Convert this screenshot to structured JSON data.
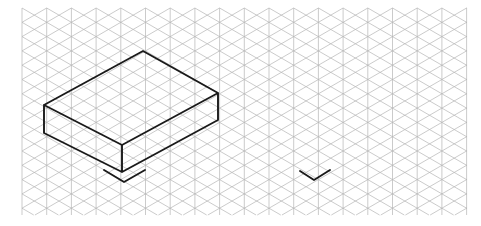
{
  "canvas": {
    "width": 481,
    "height": 226,
    "background_color": "#ffffff",
    "title": "Isometric grid sketch of a rectangular box"
  },
  "grid": {
    "type": "isometric-triangular",
    "line_color": "#b5b5b5",
    "line_width": 0.7,
    "x_start": 22,
    "x_end": 467,
    "y_start": 8,
    "y_end": 215,
    "column_spacing": 24.7,
    "row_spacing": 14.3,
    "directions": [
      "vertical",
      "diagonal-up-right",
      "diagonal-down-right"
    ]
  },
  "chart_data": {
    "type": "scatter",
    "title": "Isometric grid sketch of a rectangular box",
    "xlabel": "",
    "ylabel": "",
    "xlim": [
      0,
      481
    ],
    "ylim": [
      226,
      0
    ],
    "grid": true,
    "legend": "none",
    "annotations": [
      "cuboid drawn in heavy black line on isometric grid",
      "chevron mark beneath front-bottom vertex of the cuboid",
      "isolated chevron mark to the right of the cuboid"
    ]
  },
  "shapes": {
    "cuboid": {
      "name": "rectangular-box",
      "stroke_color": "#1a1a1a",
      "stroke_width": 1.9,
      "fill": "none",
      "vertices": {
        "top_back": [
          143,
          51
        ],
        "top_left": [
          44,
          105
        ],
        "top_right": [
          218,
          93
        ],
        "top_front": [
          122,
          145
        ],
        "bottom_left": [
          44,
          133
        ],
        "bottom_right": [
          218,
          120
        ],
        "bottom_front": [
          122,
          172
        ]
      },
      "visible_faces": [
        "top",
        "left-front",
        "right-front"
      ],
      "edges": [
        "top_back-top_left",
        "top_back-top_right",
        "top_left-top_front",
        "top_right-top_front",
        "top_left-bottom_left",
        "top_right-bottom_right",
        "top_front-bottom_front",
        "bottom_left-bottom_front",
        "bottom_right-bottom_front"
      ]
    },
    "chevron_marks": [
      {
        "name": "chevron-mark-left",
        "stroke_color": "#1a1a1a",
        "stroke_width": 1.9,
        "left_point": [
          104,
          170
        ],
        "apex": [
          124,
          182
        ],
        "right_point": [
          145,
          170
        ]
      },
      {
        "name": "chevron-mark-right",
        "stroke_color": "#1a1a1a",
        "stroke_width": 1.9,
        "left_point": [
          300,
          171
        ],
        "apex": [
          314,
          180
        ],
        "right_point": [
          330,
          170
        ]
      }
    ]
  }
}
